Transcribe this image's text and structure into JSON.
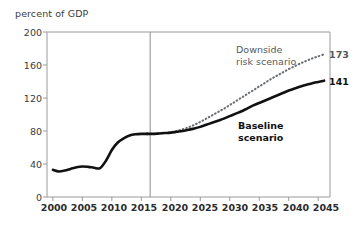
{
  "chart_data": {
    "type": "line",
    "title": "",
    "ylabel": "percent of GDP",
    "xlabel": "",
    "ylim": [
      0,
      200
    ],
    "xlim": [
      1999,
      2047
    ],
    "yticks": [
      0,
      40,
      80,
      120,
      160,
      200
    ],
    "xticks": [
      2000,
      2005,
      2010,
      2015,
      2020,
      2025,
      2030,
      2035,
      2040,
      2045
    ],
    "grid": false,
    "legend_position": "inline-annotations",
    "projection_divider_x": 2016.5,
    "series": [
      {
        "name": "Historical",
        "style": "solid",
        "color": "#111111",
        "x": [
          2000,
          2001,
          2002,
          2003,
          2004,
          2005,
          2006,
          2007,
          2008,
          2009,
          2010,
          2011,
          2012,
          2013,
          2014,
          2015,
          2016
        ],
        "values": [
          33,
          31,
          32,
          34,
          36,
          37,
          36.5,
          35.5,
          35,
          44,
          57,
          66,
          71,
          74.5,
          76,
          76.5,
          76.5
        ]
      },
      {
        "name": "Baseline scenario",
        "style": "solid",
        "color": "#111111",
        "x": [
          2016,
          2017,
          2018,
          2019,
          2020,
          2021,
          2022,
          2023,
          2024,
          2025,
          2026,
          2027,
          2028,
          2029,
          2030,
          2031,
          2032,
          2033,
          2034,
          2035,
          2036,
          2037,
          2038,
          2039,
          2040,
          2041,
          2042,
          2043,
          2044,
          2045,
          2046
        ],
        "values": [
          76.5,
          76.5,
          77,
          77.5,
          78,
          79,
          80,
          81.5,
          83,
          85,
          87.5,
          90,
          92.5,
          95,
          98,
          101,
          104,
          107.5,
          111,
          114,
          117,
          120,
          123,
          126,
          129,
          131.5,
          134,
          136,
          138,
          139.5,
          141
        ]
      },
      {
        "name": "Downside risk scenario",
        "style": "dotted",
        "color": "#6b6f73",
        "x": [
          2016,
          2017,
          2018,
          2019,
          2020,
          2021,
          2022,
          2023,
          2024,
          2025,
          2026,
          2027,
          2028,
          2029,
          2030,
          2031,
          2032,
          2033,
          2034,
          2035,
          2036,
          2037,
          2038,
          2039,
          2040,
          2041,
          2042,
          2043,
          2044,
          2045,
          2046
        ],
        "values": [
          76.5,
          76.5,
          77,
          77.5,
          78.5,
          80,
          82,
          84.5,
          87.5,
          91,
          95,
          99,
          103,
          107,
          111.5,
          116,
          120.5,
          125,
          129.5,
          134,
          138.5,
          143,
          147,
          151,
          155,
          158.5,
          162,
          165,
          168,
          170.5,
          173
        ]
      }
    ],
    "annotations": [
      {
        "text": "Downside\nrisk scenario",
        "series": "Downside risk scenario"
      },
      {
        "text": "Baseline\nscenario",
        "series": "Baseline scenario"
      }
    ],
    "endpoint_labels": [
      {
        "text": "173",
        "series": "Downside risk scenario",
        "value": 173,
        "x": 2046
      },
      {
        "text": "141",
        "series": "Baseline scenario",
        "value": 141,
        "x": 2046
      }
    ]
  },
  "colors": {
    "baseline": "#111111",
    "downside": "#6b6f73",
    "frame": "#9a9a9a",
    "text": "#2b2b2b",
    "background": "#ffffff"
  }
}
